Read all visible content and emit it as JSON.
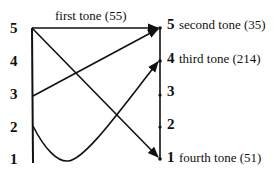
{
  "diagram": {
    "type": "tone-contour-diagram",
    "left_scale": [
      "5",
      "4",
      "3",
      "2",
      "1"
    ],
    "right_scale": [
      "5",
      "4",
      "3",
      "2",
      "1"
    ],
    "top_label": "first tone (55)",
    "right_labels": {
      "5": "second tone (35)",
      "4": "third tone (214)",
      "1": "fourth tone (51)"
    },
    "tones": [
      {
        "name": "first tone",
        "contour": "55",
        "from": 5,
        "to": 5,
        "shape": "straight"
      },
      {
        "name": "second tone",
        "contour": "35",
        "from": 3,
        "to": 5,
        "shape": "straight"
      },
      {
        "name": "third tone",
        "contour": "214",
        "from": 2,
        "to": 4,
        "shape": "dip-to-1"
      },
      {
        "name": "fourth tone",
        "contour": "51",
        "from": 5,
        "to": 1,
        "shape": "straight"
      }
    ],
    "line_color": "#111111"
  }
}
